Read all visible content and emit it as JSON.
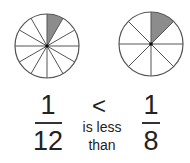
{
  "left": {
    "slices": 12,
    "shaded": 1,
    "numerator": "1",
    "denominator": "12"
  },
  "right": {
    "slices": 8,
    "shaded": 1,
    "numerator": "1",
    "denominator": "8"
  },
  "comparison": {
    "symbol": "<",
    "caption_line1": "is less",
    "caption_line2": "than"
  },
  "colors": {
    "shade": "#8c8c8c",
    "stroke": "#555555"
  }
}
